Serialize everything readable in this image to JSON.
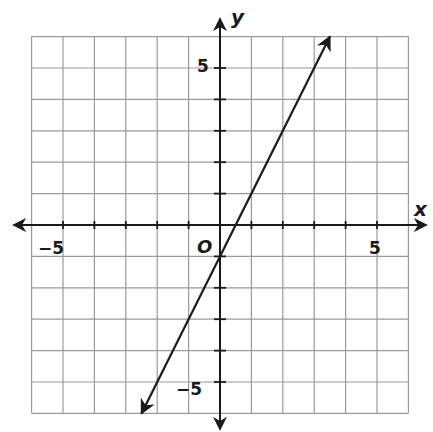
{
  "chart_data": {
    "type": "line",
    "title": "",
    "xlabel": "x",
    "ylabel": "y",
    "origin_label": "O",
    "xlim": [
      -6,
      6
    ],
    "ylim": [
      -6,
      6
    ],
    "grid": true,
    "grid_step": 1,
    "x_tick_labels": [
      {
        "value": -5,
        "label": "−5"
      },
      {
        "value": 5,
        "label": "5"
      }
    ],
    "y_tick_labels": [
      {
        "value": 5,
        "label": "5"
      },
      {
        "value": -5,
        "label": "−5"
      }
    ],
    "series": [
      {
        "name": "line",
        "equation": "y = 2x - 1",
        "slope": 2,
        "intercept": -1,
        "x": [
          -2.5,
          3.5
        ],
        "y": [
          -6,
          6
        ],
        "arrows": "both"
      }
    ],
    "colors": {
      "grid": "#9a9a9a",
      "axis": "#1a1a1a",
      "line": "#1a1a1a",
      "background": "#ffffff"
    }
  }
}
